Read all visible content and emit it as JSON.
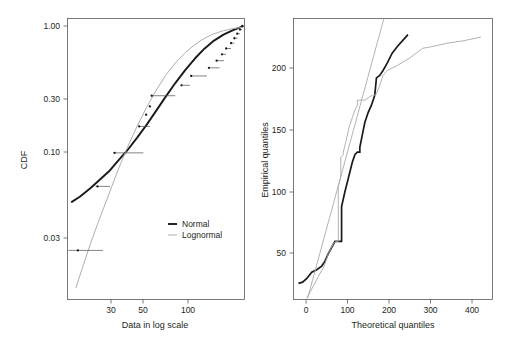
{
  "figure": {
    "width": 510,
    "height": 337,
    "background": "#ffffff",
    "panel_count": 2
  },
  "colors": {
    "normal": "#1a1a1a",
    "lognormal": "#a7a9ac",
    "axis": "#58595b",
    "text": "#231f20",
    "errorbar": "#5a5a5a"
  },
  "chart_data": [
    {
      "id": "cdf-panel",
      "type": "line",
      "title": "",
      "xlabel": "Data in log scale",
      "ylabel": "CDF",
      "xscale": "log",
      "yscale": "log",
      "grid": false,
      "legend_position": "lower right",
      "xlim": [
        14,
        230
      ],
      "ylim": [
        0.012,
        1.12
      ],
      "xticks": [
        30,
        50,
        100
      ],
      "xticklabels": [
        "30",
        "50",
        "100"
      ],
      "yticks": [
        1.0,
        0.3,
        0.1,
        0.03
      ],
      "yticklabels": [
        "1.00",
        "0.30",
        "0.10",
        "0.03"
      ],
      "legend": [
        {
          "name": "Normal",
          "color": "#1a1a1a",
          "width": 1.9
        },
        {
          "name": "Lognormal",
          "color": "#a7a9ac",
          "width": 0.95
        }
      ],
      "series": [
        {
          "name": "Normal",
          "color": "#1a1a1a",
          "x": [
            15,
            17,
            20,
            23,
            27,
            31,
            36,
            42,
            49,
            57,
            66,
            77,
            90,
            105,
            122,
            142,
            165,
            192,
            224
          ],
          "y": [
            0.058,
            0.063,
            0.072,
            0.082,
            0.095,
            0.112,
            0.133,
            0.163,
            0.202,
            0.253,
            0.316,
            0.395,
            0.487,
            0.587,
            0.688,
            0.784,
            0.864,
            0.928,
            0.985
          ]
        },
        {
          "name": "Lognormal",
          "color": "#a7a9ac",
          "x": [
            16,
            18,
            20,
            23,
            27,
            31,
            36,
            42,
            49,
            57,
            66,
            77,
            90,
            105,
            122,
            142,
            165,
            192,
            224
          ],
          "y": [
            0.0145,
            0.021,
            0.029,
            0.043,
            0.066,
            0.096,
            0.139,
            0.196,
            0.268,
            0.352,
            0.447,
            0.546,
            0.645,
            0.736,
            0.814,
            0.876,
            0.921,
            0.952,
            0.973
          ]
        }
      ],
      "empirical_points": {
        "name": "Empirical CDF with horizontal error bars",
        "marker": "dot",
        "points": [
          {
            "x": 16.5,
            "y": 0.0265,
            "xlo": 14.2,
            "xhi": 24.5
          },
          {
            "x": 22.5,
            "y": 0.0745,
            "xlo": 21.8,
            "xhi": 27.5
          },
          {
            "x": 29.5,
            "y": 0.128,
            "xlo": 28.8,
            "xhi": 46.5
          },
          {
            "x": 43.5,
            "y": 0.196,
            "xlo": 42.8,
            "xhi": 51.5
          },
          {
            "x": 48.5,
            "y": 0.237,
            "xlo": 47.8,
            "xhi": 49.5
          },
          {
            "x": 51.5,
            "y": 0.271,
            "xlo": 51.0,
            "xhi": 52.5
          },
          {
            "x": 53.0,
            "y": 0.322,
            "xlo": 52.4,
            "xhi": 77.0
          },
          {
            "x": 85.0,
            "y": 0.381,
            "xlo": 84.3,
            "xhi": 97.0
          },
          {
            "x": 99.0,
            "y": 0.443,
            "xlo": 98.3,
            "xhi": 127.0
          },
          {
            "x": 131.0,
            "y": 0.505,
            "xlo": 130.3,
            "xhi": 155.0
          },
          {
            "x": 148.0,
            "y": 0.567,
            "xlo": 147.4,
            "xhi": 166.0
          },
          {
            "x": 161.0,
            "y": 0.628,
            "xlo": 160.4,
            "xhi": 172.0
          },
          {
            "x": 172.0,
            "y": 0.69,
            "xlo": 171.5,
            "xhi": 186.0
          },
          {
            "x": 186.0,
            "y": 0.752,
            "xlo": 185.5,
            "xhi": 196.0
          },
          {
            "x": 196.0,
            "y": 0.814,
            "xlo": 195.5,
            "xhi": 206.0
          },
          {
            "x": 205.0,
            "y": 0.876,
            "xlo": 204.5,
            "xhi": 214.0
          },
          {
            "x": 214.0,
            "y": 0.937,
            "xlo": 213.5,
            "xhi": 221.0
          },
          {
            "x": 222.0,
            "y": 0.995,
            "xlo": 221.5,
            "xhi": 226.0
          }
        ]
      }
    },
    {
      "id": "qq-panel",
      "type": "line",
      "title": "",
      "xlabel": "Theoretical quantiles",
      "ylabel": "Empirical quantiles",
      "xscale": "linear",
      "yscale": "linear",
      "grid": false,
      "legend_position": "none",
      "xlim": [
        -30,
        450
      ],
      "ylim": [
        5,
        232
      ],
      "xticks": [
        0,
        100,
        200,
        300,
        400
      ],
      "xticklabels": [
        "0",
        "100",
        "200",
        "300",
        "400"
      ],
      "yticks": [
        50,
        100,
        150,
        200
      ],
      "yticklabels": [
        "50",
        "100",
        "150",
        "200"
      ],
      "series": [
        {
          "name": "Normal",
          "color": "#1a1a1a",
          "style": "step-like",
          "x": [
            -18,
            -8,
            2,
            14,
            26,
            38,
            46,
            54,
            62,
            70,
            78,
            78,
            86,
            86,
            94,
            100,
            106,
            112,
            118,
            124,
            130,
            130,
            136,
            142,
            150,
            158,
            166,
            170,
            178,
            186,
            196,
            208,
            222,
            238,
            246
          ],
          "y": [
            18,
            19,
            22,
            27,
            29,
            32,
            36,
            42,
            47,
            52,
            52,
            52,
            52,
            80,
            92,
            100,
            108,
            116,
            122,
            124,
            124,
            128,
            138,
            148,
            156,
            162,
            170,
            184,
            186,
            190,
            196,
            204,
            210,
            216,
            219
          ]
        },
        {
          "name": "Lognormal",
          "color": "#a7a9ac",
          "style": "step-like",
          "x": [
            2,
            18,
            34,
            44,
            54,
            60,
            66,
            72,
            72,
            78,
            78,
            84,
            84,
            90,
            90,
            96,
            104,
            112,
            118,
            124,
            124,
            130,
            136,
            142,
            150,
            160,
            168,
            176,
            186,
            196,
            220,
            250,
            282,
            300,
            340,
            380,
            422
          ],
          "y": [
            6,
            16,
            26,
            32,
            42,
            46,
            50,
            52,
            52,
            52,
            96,
            104,
            120,
            122,
            124,
            132,
            144,
            152,
            158,
            162,
            166,
            166,
            166,
            166,
            168,
            170,
            170,
            176,
            186,
            190,
            194,
            200,
            208,
            209,
            212,
            214,
            217
          ]
        },
        {
          "name": "Reference line",
          "color": "#a7a9ac",
          "style": "straight",
          "x": [
            4,
            188
          ],
          "y": [
            6,
            232
          ]
        }
      ]
    }
  ],
  "panels": {
    "left": {
      "name": "cdf-panel",
      "ylabel": "CDF",
      "xlabel": "Data in log scale",
      "yticklabels": [
        "1.00",
        "0.30",
        "0.10",
        "0.03"
      ],
      "xticklabels": [
        "30",
        "50",
        "100"
      ],
      "legend": {
        "normal_label": "Normal",
        "lognormal_label": "Lognormal"
      }
    },
    "right": {
      "name": "qq-panel",
      "ylabel": "Empirical quantiles",
      "xlabel": "Theoretical quantiles",
      "yticklabels": [
        "50",
        "100",
        "150",
        "200"
      ],
      "xticklabels": [
        "0",
        "100",
        "200",
        "300",
        "400"
      ]
    }
  }
}
